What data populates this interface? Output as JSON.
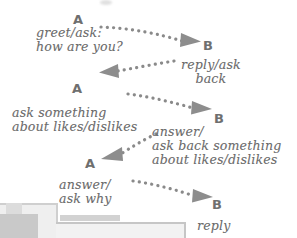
{
  "diagram": {
    "background_color": "#ffffff",
    "ink_color": "#6b6b6b",
    "arrow_color": "#808080",
    "actors": [
      {
        "id": "a1",
        "label": "A",
        "x": 73,
        "y": 13
      },
      {
        "id": "b1",
        "label": "B",
        "x": 203,
        "y": 39
      },
      {
        "id": "a2",
        "label": "A",
        "x": 72,
        "y": 82
      },
      {
        "id": "b2",
        "label": "B",
        "x": 214,
        "y": 112
      },
      {
        "id": "a3",
        "label": "A",
        "x": 85,
        "y": 157
      },
      {
        "id": "b3",
        "label": "B",
        "x": 212,
        "y": 198
      }
    ],
    "messages": [
      {
        "id": "m1",
        "from": "A",
        "to": "B",
        "direction": "right",
        "label": "greet/ask:\nhow are you?",
        "label_x": 36,
        "label_y": 26
      },
      {
        "id": "m2",
        "from": "B",
        "to": "A",
        "direction": "left",
        "label": "reply/ask\nback",
        "label_x": 181,
        "label_y": 58
      },
      {
        "id": "m3",
        "from": "A",
        "to": "B",
        "direction": "right",
        "label": "ask something\nabout likes/dislikes",
        "label_x": 12,
        "label_y": 106
      },
      {
        "id": "m4",
        "from": "B",
        "to": "A",
        "direction": "left",
        "label": "answer/\nask back something\nabout likes/dislikes",
        "label_x": 152,
        "label_y": 125
      },
      {
        "id": "m5",
        "from": "A",
        "to": "B",
        "direction": "right",
        "label": "answer/\nask why",
        "label_x": 59,
        "label_y": 178
      },
      {
        "id": "m6",
        "from": "B",
        "to": "A",
        "direction": "none",
        "label": "reply",
        "label_x": 197,
        "label_y": 219
      }
    ],
    "arrow_style": {
      "line": "dotted",
      "dot_radius": 1.6,
      "head": "solid-triangle"
    }
  }
}
